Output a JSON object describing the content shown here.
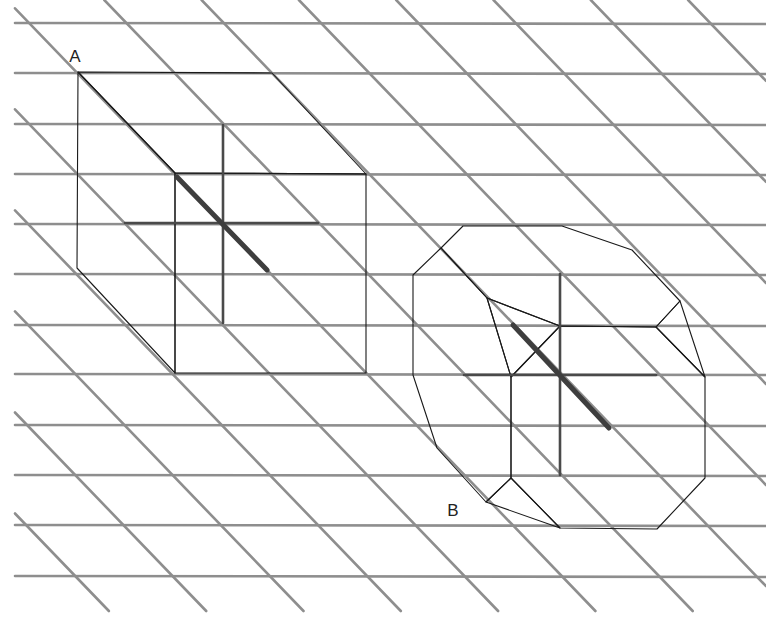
{
  "figure": {
    "width": 766,
    "height": 628,
    "background": "#ffffff",
    "grid": {
      "color": "#8e8e8e",
      "horizontal_lines_y": [
        23,
        73,
        124,
        174,
        224,
        274,
        325,
        374,
        425,
        475,
        525,
        576
      ],
      "horizontal_x_start": 15,
      "horizontal_x_end": 766,
      "diagonal_slope_dx_per_dy": 0.963,
      "diagonal_spacing_x": 97.3,
      "diagonal_y_end": 611
    },
    "solids": [
      {
        "id": "cube",
        "label": "A",
        "label_pos": [
          75,
          62
        ],
        "description": "cube in oblique projection",
        "faces": {
          "top": [
            [
              78,
              72
            ],
            [
              272,
              73
            ],
            [
              366,
              174
            ],
            [
              175,
              173
            ]
          ],
          "left": [
            [
              78,
              72
            ],
            [
              175,
              173
            ],
            [
              175,
              373
            ],
            [
              77,
              268
            ]
          ],
          "front": [
            [
              175,
              173
            ],
            [
              366,
              174
            ],
            [
              366,
              373
            ],
            [
              175,
              373
            ]
          ]
        },
        "axes": {
          "vertical": [
            [
              223,
              125
            ],
            [
              223,
              323
            ]
          ],
          "horizontal": [
            [
              125,
              223
            ],
            [
              318,
              223
            ]
          ],
          "depth": [
            [
              177,
              177
            ],
            [
              267,
              270
            ]
          ]
        }
      },
      {
        "id": "truncated-cube",
        "label": "B",
        "label_pos": [
          453,
          516
        ],
        "description": "cube with truncated corners/edges in oblique projection",
        "faces": {
          "top": [
            [
              463,
              226
            ],
            [
              562,
              226
            ],
            [
              632,
              250
            ],
            [
              680,
              301
            ],
            [
              656,
              327
            ],
            [
              560,
              326
            ],
            [
              487,
              298
            ],
            [
              441,
              248
            ]
          ],
          "top_right_corner": [
            [
              680,
              301
            ],
            [
              705,
              377
            ],
            [
              656,
              327
            ]
          ],
          "front": [
            [
              560,
              326
            ],
            [
              656,
              327
            ],
            [
              705,
              377
            ],
            [
              705,
              478
            ],
            [
              657,
              529
            ],
            [
              560,
              528
            ],
            [
              511,
              478
            ],
            [
              511,
              377
            ]
          ],
          "left": [
            [
              441,
              248
            ],
            [
              487,
              298
            ],
            [
              511,
              377
            ],
            [
              511,
              478
            ],
            [
              486,
              502
            ],
            [
              437,
              448
            ],
            [
              413,
              375
            ],
            [
              413,
              275
            ]
          ],
          "notch": [
            [
              487,
              298
            ],
            [
              560,
              326
            ],
            [
              511,
              377
            ]
          ],
          "bottom_left_corner": [
            [
              511,
              478
            ],
            [
              560,
              528
            ],
            [
              486,
              502
            ]
          ]
        },
        "axes": {
          "vertical": [
            [
              560,
              274
            ],
            [
              560,
              475
            ]
          ],
          "horizontal": [
            [
              464,
              375
            ],
            [
              656,
              375
            ]
          ],
          "depth": [
            [
              513,
              325
            ],
            [
              609,
              428
            ]
          ]
        }
      }
    ],
    "colors": {
      "edge": "#1a1a1a",
      "axis": "#4a4a4a",
      "top_face": "#e2e2e2",
      "front_face": "#cbcbcb",
      "left_face": "#a9a9a9",
      "corner_face": "#b8b8b8",
      "notch_face": "#ffffff",
      "highlight": "#ffffff"
    }
  }
}
